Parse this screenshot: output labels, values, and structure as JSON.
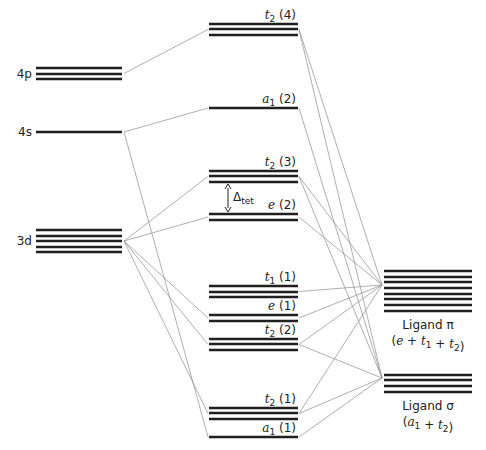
{
  "diagram": {
    "title": "",
    "metal_orbitals": [
      {
        "id": "4p",
        "label": "4p",
        "degeneracy": 3
      },
      {
        "id": "4s",
        "label": "4s",
        "degeneracy": 1
      },
      {
        "id": "3d",
        "label": "3d",
        "degeneracy": 5
      }
    ],
    "mo_levels": [
      {
        "id": "t2_4",
        "sym": "t",
        "sub": "2",
        "count": "(4)",
        "degeneracy": 3
      },
      {
        "id": "a1_2",
        "sym": "a",
        "sub": "1",
        "count": "(2)",
        "degeneracy": 1
      },
      {
        "id": "t2_3",
        "sym": "t",
        "sub": "2",
        "count": "(3)",
        "degeneracy": 3
      },
      {
        "id": "e_2",
        "sym": "e",
        "sub": "",
        "count": "(2)",
        "degeneracy": 2
      },
      {
        "id": "t1_1",
        "sym": "t",
        "sub": "1",
        "count": "(1)",
        "degeneracy": 3
      },
      {
        "id": "e_1",
        "sym": "e",
        "sub": "",
        "count": "(1)",
        "degeneracy": 2
      },
      {
        "id": "t2_2",
        "sym": "t",
        "sub": "2",
        "count": "(2)",
        "degeneracy": 3
      },
      {
        "id": "t2_1",
        "sym": "t",
        "sub": "2",
        "count": "(1)",
        "degeneracy": 3
      },
      {
        "id": "a1_1",
        "sym": "a",
        "sub": "1",
        "count": "(1)",
        "degeneracy": 1
      }
    ],
    "ligand_groups": [
      {
        "id": "pi",
        "name": "Ligand π",
        "composition": [
          "e",
          "t1",
          "t2"
        ],
        "degeneracy": 8
      },
      {
        "id": "sigma",
        "name": "Ligand σ",
        "composition": [
          "a1",
          "t2"
        ],
        "degeneracy": 4
      }
    ],
    "splitting": {
      "symbol": "Δ",
      "sub": "tet",
      "between": [
        "t2_3",
        "e_2"
      ]
    },
    "connections": [
      [
        "4p",
        "t2_4"
      ],
      [
        "4s",
        "a1_2"
      ],
      [
        "4s",
        "a1_1"
      ],
      [
        "3d",
        "t2_3"
      ],
      [
        "3d",
        "e_2"
      ],
      [
        "3d",
        "t2_2"
      ],
      [
        "3d",
        "e_1"
      ],
      [
        "3d",
        "t2_1"
      ],
      [
        "t2_4",
        "pi"
      ],
      [
        "t2_4",
        "sigma"
      ],
      [
        "a1_2",
        "sigma"
      ],
      [
        "t2_3",
        "pi"
      ],
      [
        "t2_3",
        "sigma"
      ],
      [
        "e_2",
        "pi"
      ],
      [
        "t1_1",
        "pi"
      ],
      [
        "e_1",
        "pi"
      ],
      [
        "t2_2",
        "pi"
      ],
      [
        "t2_2",
        "sigma"
      ],
      [
        "t2_1",
        "pi"
      ],
      [
        "t2_1",
        "sigma"
      ],
      [
        "a1_1",
        "sigma"
      ]
    ]
  }
}
